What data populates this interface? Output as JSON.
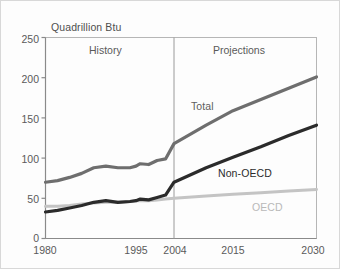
{
  "chart_data": {
    "type": "line",
    "title": "Quadrillion Btu",
    "xlabel": "",
    "ylabel": "Quadrillion Btu",
    "ylim": [
      0,
      250
    ],
    "yticks": [
      0,
      50,
      100,
      150,
      200,
      250
    ],
    "xticks": [
      "1980",
      "1995",
      "2004",
      "2015",
      "2030"
    ],
    "grid": false,
    "legend": "inline-annotations",
    "annotations": [
      {
        "text": "History",
        "region": "left-of-2004"
      },
      {
        "text": "Projections",
        "region": "right-of-2004"
      },
      {
        "text": "Total",
        "series": "Total"
      },
      {
        "text": "Non-OECD",
        "series": "Non-OECD"
      },
      {
        "text": "OECD",
        "series": "OECD"
      }
    ],
    "divider_year": 2004,
    "x": [
      1980,
      1982,
      1984,
      1986,
      1988,
      1990,
      1992,
      1994,
      1995,
      1996,
      1998,
      2000,
      2002,
      2004,
      2010,
      2015,
      2020,
      2025,
      2030
    ],
    "series": [
      {
        "name": "Total",
        "color": "#6e6e6e",
        "values": [
          70,
          72,
          76,
          81,
          88,
          90,
          88,
          88,
          90,
          93,
          92,
          97,
          99,
          118,
          141,
          159,
          173,
          187,
          201
        ]
      },
      {
        "name": "Non-OECD",
        "color": "#2b2b2b",
        "values": [
          33,
          35,
          38,
          41,
          45,
          47,
          45,
          46,
          47,
          49,
          48,
          51,
          54,
          70,
          88,
          101,
          114,
          128,
          141
        ]
      },
      {
        "name": "OECD",
        "color": "#c4c4c4",
        "values": [
          40,
          40,
          41,
          43,
          44,
          45,
          45,
          46,
          47,
          47,
          47,
          48,
          49,
          50,
          53,
          55,
          57,
          59,
          61
        ]
      }
    ]
  },
  "axis": {
    "y_labels": [
      "250",
      "200",
      "150",
      "100",
      "50",
      "0"
    ],
    "x_labels": [
      "1980",
      "1995",
      "2004",
      "2015",
      "2030"
    ]
  },
  "labels": {
    "title": "Quadrillion Btu",
    "history": "History",
    "projections": "Projections",
    "total": "Total",
    "non_oecd": "Non-OECD",
    "oecd": "OECD"
  },
  "colors": {
    "total": "#6e6e6e",
    "non_oecd": "#2b2b2b",
    "oecd": "#c4c4c4",
    "axis": "#8a8a8a",
    "text": "#5a5a5a"
  }
}
